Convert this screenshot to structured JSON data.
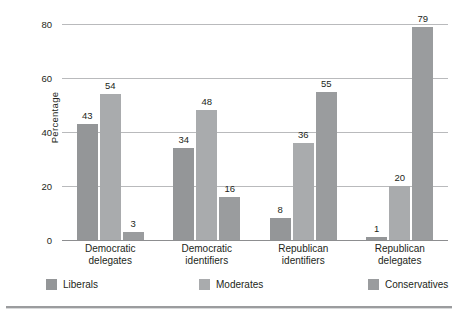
{
  "chart_data": {
    "type": "bar",
    "title": "",
    "xlabel": "",
    "ylabel": "Percentage",
    "ylim": [
      0,
      80
    ],
    "yticks": [
      0,
      20,
      40,
      60,
      80
    ],
    "grid": true,
    "legend_position": "bottom",
    "categories": [
      "Democratic delegates",
      "Democratic identifiers",
      "Republican identifiers",
      "Republican delegates"
    ],
    "category_lines": [
      [
        "Democratic",
        "delegates"
      ],
      [
        "Democratic",
        "identifiers"
      ],
      [
        "Republican",
        "identifiers"
      ],
      [
        "Republican",
        "delegates"
      ]
    ],
    "series": [
      {
        "name": "Liberals",
        "color": "#949698",
        "values": [
          43,
          34,
          8,
          1
        ]
      },
      {
        "name": "Moderates",
        "color": "#a9abad",
        "values": [
          54,
          48,
          36,
          20
        ]
      },
      {
        "name": "Conservatives",
        "color": "#9a9c9e",
        "values": [
          3,
          16,
          55,
          79
        ]
      }
    ]
  },
  "axis": {
    "y_title": "Percentage",
    "y_tick_labels": [
      "80",
      "60",
      "40",
      "20",
      "0"
    ]
  },
  "legend": {
    "items": [
      {
        "label": "Liberals"
      },
      {
        "label": "Moderates"
      },
      {
        "label": "Conservatives"
      }
    ]
  }
}
